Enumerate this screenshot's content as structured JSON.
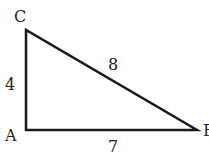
{
  "figure": {
    "type": "right-triangle",
    "vertices": {
      "A": {
        "label": "A",
        "x": 26,
        "y": 130
      },
      "B": {
        "label": "B",
        "x": 197,
        "y": 130
      },
      "C": {
        "label": "C",
        "x": 26,
        "y": 30
      }
    },
    "sides": {
      "AC": {
        "label": "4"
      },
      "CB": {
        "label": "8"
      },
      "AB": {
        "label": "7"
      }
    },
    "stroke_color": "#1a1a1a"
  }
}
